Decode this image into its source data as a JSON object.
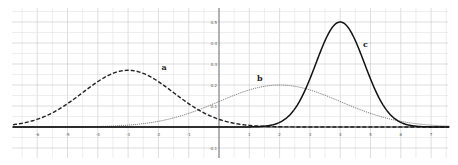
{
  "chart_data": {
    "type": "line",
    "title": "",
    "xlabel": "",
    "ylabel": "",
    "xlim": [
      -6.8,
      7.6
    ],
    "ylim": [
      -0.13,
      0.56
    ],
    "grid": true,
    "minor_grid": true,
    "legend": "none",
    "x_ticks": [
      -6,
      -5,
      -4,
      -3,
      -2,
      -1,
      1,
      2,
      3,
      4,
      5,
      6,
      7
    ],
    "y_ticks": [
      0.5,
      0.4,
      0.3,
      0.2,
      0.1,
      -0.1
    ],
    "series": [
      {
        "name": "a",
        "kind": "normal",
        "mean": -3,
        "sd": 1.5,
        "peak": 0.27,
        "style": "dashed",
        "color": "#222222",
        "label_pos": [
          -1.9,
          0.27
        ]
      },
      {
        "name": "b",
        "kind": "normal",
        "mean": 2,
        "sd": 2,
        "peak": 0.2,
        "style": "dotted",
        "color": "#555555",
        "label_pos": [
          1.25,
          0.22
        ]
      },
      {
        "name": "c",
        "kind": "normal",
        "mean": 4,
        "sd": 0.8,
        "peak": 0.5,
        "style": "solid",
        "color": "#111111",
        "label_pos": [
          4.75,
          0.38
        ]
      }
    ]
  }
}
